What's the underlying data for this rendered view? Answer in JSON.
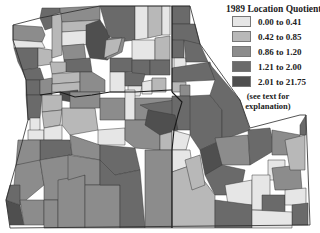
{
  "legend": {
    "title": "1989 Location Quotients",
    "classes": [
      {
        "label": "0.00 to 0.41",
        "color": "#e6e6e6"
      },
      {
        "label": "0.42 to 0.85",
        "color": "#b8b8b8"
      },
      {
        "label": "0.86 to 1.20",
        "color": "#8c8c8c"
      },
      {
        "label": "1.21 to 2.00",
        "color": "#6a6a6a"
      },
      {
        "label": "2.01 to 21.75",
        "color": "#4f4f4f"
      }
    ],
    "note_line1": "(see text for",
    "note_line2": "explanation)"
  },
  "map": {
    "subject": "County location quotients, Washington / Oregon / Idaho",
    "states": [
      "Washington",
      "Oregon",
      "Idaho"
    ],
    "border_color": "#1a1a1a",
    "county_edge_color": "#3a3a3a"
  }
}
